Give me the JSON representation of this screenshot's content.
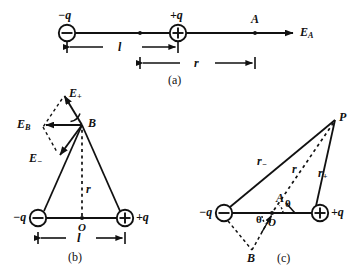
{
  "figure": {
    "ink_color": "#111111",
    "background": "#ffffff"
  },
  "panels": [
    {
      "id": "a",
      "tag": "(a)",
      "description": "Axial point A on the dipole axis",
      "charges": [
        {
          "name": "negative-charge",
          "label": "−q",
          "sign": "−",
          "x": 67,
          "y": 33
        },
        {
          "name": "positive-charge",
          "label": "+q",
          "sign": "+",
          "x": 178,
          "y": 33
        }
      ],
      "points": [
        {
          "name": "point-A",
          "label": "A",
          "x": 255,
          "y": 33
        }
      ],
      "field_vector": {
        "name": "field-E-A",
        "label": "E",
        "subscript": "A"
      },
      "dimensions": [
        {
          "name": "dimension-l",
          "label": "l",
          "from_x": 67,
          "to_x": 178,
          "y": 47
        },
        {
          "name": "dimension-r",
          "label": "r",
          "from_x": 140,
          "to_x": 255,
          "y": 63
        }
      ]
    },
    {
      "id": "b",
      "tag": "(b)",
      "description": "Field at point B on the perpendicular bisector",
      "charges": [
        {
          "name": "negative-charge",
          "label": "−q",
          "sign": "−",
          "x": 38,
          "y": 218
        },
        {
          "name": "positive-charge",
          "label": "+q",
          "sign": "+",
          "x": 125,
          "y": 218
        }
      ],
      "points": [
        {
          "name": "point-B",
          "label": "B",
          "x": 82,
          "y": 125
        },
        {
          "name": "origin-O",
          "label": "O",
          "x": 82,
          "y": 218
        }
      ],
      "vectors": [
        {
          "name": "field-E-plus",
          "label": "E",
          "subscript": "+"
        },
        {
          "name": "field-E-minus",
          "label": "E",
          "subscript": "−"
        },
        {
          "name": "field-E-B",
          "label": "E",
          "subscript": "B"
        }
      ],
      "distances": [
        {
          "name": "distance-r",
          "label": "r"
        }
      ],
      "dimensions": [
        {
          "name": "dimension-l",
          "label": "l",
          "from_x": 38,
          "to_x": 125,
          "y": 238
        }
      ]
    },
    {
      "id": "c",
      "tag": "(c)",
      "description": "General field point P with angles theta",
      "charges": [
        {
          "name": "negative-charge",
          "label": "−q",
          "sign": "−",
          "x": 224,
          "y": 213
        },
        {
          "name": "positive-charge",
          "label": "+q",
          "sign": "+",
          "x": 320,
          "y": 213
        }
      ],
      "points": [
        {
          "name": "point-P",
          "label": "P",
          "x": 335,
          "y": 118
        },
        {
          "name": "point-A",
          "label": "A",
          "x": 280,
          "y": 200
        },
        {
          "name": "point-B",
          "label": "B",
          "x": 252,
          "y": 250
        },
        {
          "name": "origin-O",
          "label": "O",
          "x": 272,
          "y": 213
        }
      ],
      "distances": [
        {
          "name": "distance-r-minus",
          "label": "r",
          "subscript": "−"
        },
        {
          "name": "distance-r",
          "label": "r"
        },
        {
          "name": "distance-r-plus",
          "label": "r",
          "subscript": "+"
        }
      ],
      "angles": [
        {
          "name": "angle-theta-upper",
          "label": "θ"
        },
        {
          "name": "angle-theta-lower",
          "label": "θ"
        }
      ]
    }
  ]
}
